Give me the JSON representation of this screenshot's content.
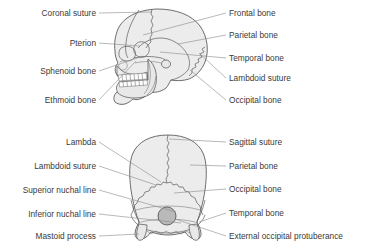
{
  "figure": {
    "colors": {
      "bone_fill": "#ececec",
      "bone_outline": "#4a4a4a",
      "suture_line": "#5a5a5a",
      "leader_line": "#8a8a8a",
      "label_text": "#3a3a3a",
      "foramen_fill": "#b9b9b9",
      "background": "#ffffff"
    },
    "panels": [
      {
        "id": "lateral-view",
        "name": "Lateral view of skull",
        "labels_left": [
          {
            "id": "coronal-suture",
            "text": "Coronal suture",
            "x": 96,
            "y": 16,
            "tip_x": 152,
            "tip_y": 12
          },
          {
            "id": "pterion",
            "text": "Pterion",
            "x": 96,
            "y": 46,
            "tip_x": 141,
            "tip_y": 46
          },
          {
            "id": "sphenoid-bone",
            "text": "Sphenoid bone",
            "x": 96,
            "y": 74,
            "tip_x": 142,
            "tip_y": 56
          },
          {
            "id": "ethmoid-bone",
            "text": "Ethmoid bone",
            "x": 96,
            "y": 103,
            "tip_x": 136,
            "tip_y": 62
          }
        ],
        "labels_right": [
          {
            "id": "frontal-bone",
            "text": "Frontal bone",
            "x": 229,
            "y": 16,
            "tip_x": 142,
            "tip_y": 35
          },
          {
            "id": "parietal-bone",
            "text": "Parietal bone",
            "x": 229,
            "y": 38,
            "tip_x": 177,
            "tip_y": 44
          },
          {
            "id": "temporal-bone",
            "text": "Temporal bone",
            "x": 229,
            "y": 61,
            "tip_x": 160,
            "tip_y": 52
          },
          {
            "id": "lambdoid-suture",
            "text": "Lambdoid suture",
            "x": 229,
            "y": 81,
            "tip_x": 198,
            "tip_y": 53
          },
          {
            "id": "occipital-bone",
            "text": "Occipital bone",
            "x": 229,
            "y": 103,
            "tip_x": 190,
            "tip_y": 70
          }
        ]
      },
      {
        "id": "posterior-view",
        "name": "Posterior view of skull",
        "labels_left": [
          {
            "id": "lambda",
            "text": "Lambda",
            "x": 96,
            "y": 145,
            "tip_x": 161,
            "tip_y": 182
          },
          {
            "id": "lambdoid-suture-2",
            "text": "Lambdoid suture",
            "x": 96,
            "y": 169,
            "tip_x": 157,
            "tip_y": 183
          },
          {
            "id": "superior-nuchal-line",
            "text": "Superior nuchal line",
            "x": 96,
            "y": 193,
            "tip_x": 176,
            "tip_y": 213
          },
          {
            "id": "inferior-nuchal-line",
            "text": "Inferior nuchal line",
            "x": 96,
            "y": 217,
            "tip_x": 180,
            "tip_y": 224
          },
          {
            "id": "mastoid-process",
            "text": "Mastoid process",
            "x": 96,
            "y": 239,
            "tip_x": 140,
            "tip_y": 235
          }
        ],
        "labels_right": [
          {
            "id": "sagittal-suture",
            "text": "Sagittal suture",
            "x": 229,
            "y": 145,
            "tip_x": 168,
            "tip_y": 139
          },
          {
            "id": "parietal-bone-2",
            "text": "Parietal bone",
            "x": 229,
            "y": 169,
            "tip_x": 190,
            "tip_y": 166
          },
          {
            "id": "occipital-bone-2",
            "text": "Occipital bone",
            "x": 229,
            "y": 192,
            "tip_x": 173,
            "tip_y": 193
          },
          {
            "id": "temporal-bone-2",
            "text": "Temporal bone",
            "x": 229,
            "y": 216,
            "tip_x": 199,
            "tip_y": 222
          },
          {
            "id": "external-occipital-protuberance",
            "text": "External occipital protuberance",
            "x": 229,
            "y": 239,
            "tip_x": 176,
            "tip_y": 218
          }
        ]
      }
    ]
  }
}
